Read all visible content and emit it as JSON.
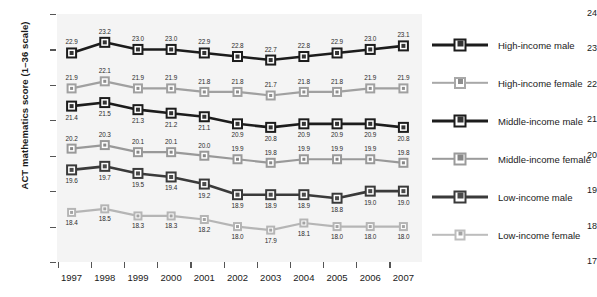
{
  "chart_data": {
    "type": "line",
    "title": "",
    "xlabel": "",
    "ylabel": "ACT mathematics score (1–36 scale)",
    "x": [
      1997,
      1998,
      1999,
      2000,
      2001,
      2002,
      2003,
      2004,
      2005,
      2006,
      2007
    ],
    "categories": [
      "1997",
      "1998",
      "1999",
      "2000",
      "2001",
      "2002",
      "2003",
      "2004",
      "2005",
      "2006",
      "2007"
    ],
    "ylim": [
      17,
      24
    ],
    "yticks": [
      17,
      18,
      19,
      20,
      21,
      22,
      23,
      24
    ],
    "ytick_labels": [
      "17",
      "18",
      "19",
      "20",
      "21",
      "22",
      "23",
      "24"
    ],
    "grid": false,
    "legend_position": "right",
    "plot_background": "#f4f4f4",
    "series": [
      {
        "name": "High-income male",
        "color": "#1c1c1c",
        "marker_fill": "#333333",
        "label_side": "above",
        "values": [
          22.9,
          23.2,
          23.0,
          23.0,
          22.9,
          22.8,
          22.7,
          22.8,
          22.9,
          23.0,
          23.1
        ],
        "value_labels": [
          "22.9",
          "23.2",
          "23.0",
          "23.0",
          "22.9",
          "22.8",
          "22.7",
          "22.8",
          "22.9",
          "23.0",
          "23.1"
        ]
      },
      {
        "name": "High-income female",
        "color": "#a0a0a0",
        "marker_fill": "#8e8e8e",
        "label_side": "above",
        "values": [
          21.9,
          22.1,
          21.9,
          21.9,
          21.8,
          21.8,
          21.7,
          21.8,
          21.8,
          21.9,
          21.9
        ],
        "value_labels": [
          "21.9",
          "22.1",
          "21.9",
          "21.9",
          "21.8",
          "21.8",
          "21.7",
          "21.8",
          "21.8",
          "21.9",
          "21.9"
        ]
      },
      {
        "name": "Middle-income male",
        "color": "#1c1c1c",
        "marker_fill": "#333333",
        "label_side": "below",
        "values": [
          21.4,
          21.5,
          21.3,
          21.2,
          21.1,
          20.9,
          20.8,
          20.9,
          20.9,
          20.9,
          20.8
        ],
        "value_labels": [
          "21.4",
          "21.5",
          "21.3",
          "21.2",
          "21.1",
          "20.9",
          "20.8",
          "20.9",
          "20.9",
          "20.9",
          "20.8"
        ]
      },
      {
        "name": "Middle-income female",
        "color": "#999999",
        "marker_fill": "#878787",
        "label_side": "above",
        "values": [
          20.2,
          20.3,
          20.1,
          20.1,
          20.0,
          19.9,
          19.8,
          19.9,
          19.9,
          19.9,
          19.8
        ],
        "value_labels": [
          "20.2",
          "20.3",
          "20.1",
          "20.1",
          "20.0",
          "19.9",
          "19.8",
          "19.9",
          "19.9",
          "19.9",
          "19.8"
        ]
      },
      {
        "name": "Low-income male",
        "color": "#3a3a3a",
        "marker_fill": "#4a4a4a",
        "label_side": "below",
        "values": [
          19.6,
          19.7,
          19.5,
          19.4,
          19.2,
          18.9,
          18.9,
          18.9,
          18.8,
          19.0,
          19.0
        ],
        "value_labels": [
          "19.6",
          "19.7",
          "19.5",
          "19.4",
          "19.2",
          "18.9",
          "18.9",
          "18.9",
          "18.8",
          "19.0",
          "19.0"
        ]
      },
      {
        "name": "Low-income female",
        "color": "#b5b5b5",
        "marker_fill": "#a3a3a3",
        "label_side": "below",
        "values": [
          18.4,
          18.5,
          18.3,
          18.3,
          18.2,
          18.0,
          17.9,
          18.1,
          18.0,
          18.0,
          18.0
        ],
        "value_labels": [
          "18.4",
          "18.5",
          "18.3",
          "18.3",
          "18.2",
          "18.0",
          "17.9",
          "18.1",
          "18.0",
          "18.0",
          "18.0"
        ]
      }
    ]
  },
  "legend": {
    "items": [
      {
        "label": "High-income male",
        "color": "#1c1c1c",
        "marker_fill": "#333333",
        "line_width": 3.0,
        "marker_size": 13
      },
      {
        "label": "High-income female",
        "color": "#a8a8a8",
        "marker_fill": "#8e8e8e",
        "line_width": 2.4,
        "marker_size": 12
      },
      {
        "label": "Middle-income male",
        "color": "#1c1c1c",
        "marker_fill": "#333333",
        "line_width": 3.0,
        "marker_size": 13
      },
      {
        "label": "Middle-income female",
        "color": "#9b9b9b",
        "marker_fill": "#878787",
        "line_width": 2.4,
        "marker_size": 13
      },
      {
        "label": "Low-income male",
        "color": "#3a3a3a",
        "marker_fill": "#4a4a4a",
        "line_width": 3.0,
        "marker_size": 13
      },
      {
        "label": "Low-income female",
        "color": "#bdbdbd",
        "marker_fill": "#a3a3a3",
        "line_width": 2.4,
        "marker_size": 11
      }
    ]
  }
}
